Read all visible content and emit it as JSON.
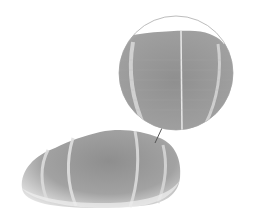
{
  "figure": {
    "background_color": "#ffffff",
    "object_color": "#9a9a9a",
    "highlight_color": "#d8d8d8",
    "inset_outline_color": "#bdbdbd",
    "leader_line_color": "#555555"
  }
}
